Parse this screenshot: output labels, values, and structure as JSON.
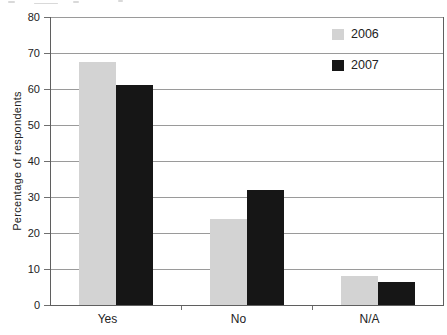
{
  "chart_data": {
    "type": "bar",
    "categories": [
      "Yes",
      "No",
      "N/A"
    ],
    "series": [
      {
        "name": "2006",
        "color": "#d3d3d3",
        "values": [
          67.5,
          24,
          8
        ]
      },
      {
        "name": "2007",
        "color": "#161616",
        "values": [
          61,
          32,
          6.5
        ]
      }
    ],
    "title": "",
    "xlabel": "",
    "ylabel": "Percentage of respondents",
    "ylim": [
      0,
      80
    ],
    "yticks": [
      80,
      70,
      60,
      50,
      40,
      30,
      20,
      10,
      0
    ],
    "grid": true,
    "gridline_color": "#9a9a9a",
    "legend_position": "top-right",
    "legend": [
      "2006",
      "2007"
    ]
  }
}
